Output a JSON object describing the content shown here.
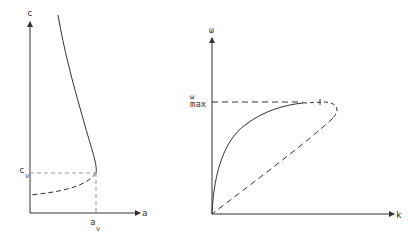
{
  "left_diagram": {
    "y_axis_label": "c",
    "x_axis_label": "a",
    "y_mark_label_main": "c",
    "y_mark_label_sub": "ν",
    "x_mark_label_main": "a",
    "x_mark_label_sub": "ν"
  },
  "right_diagram": {
    "y_axis_label": "ω",
    "x_axis_label": "k",
    "y_mark_label_main": "ω",
    "y_mark_label_sub": "max"
  },
  "colors": {
    "line": "#333333",
    "guide": "#999999"
  }
}
